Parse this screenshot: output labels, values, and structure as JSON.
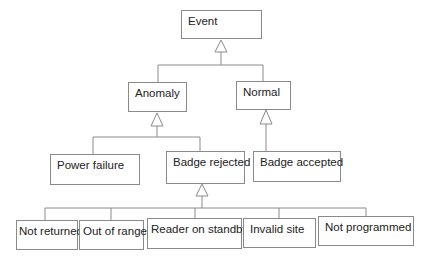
{
  "diagram": {
    "type": "uml-class-hierarchy",
    "nodes": {
      "event": "Event",
      "anomaly": "Anomaly",
      "normal": "Normal",
      "power_failure": "Power failure",
      "badge_rejected": "Badge rejected",
      "badge_accepted": "Badge accepted",
      "not_returned": "Not returned",
      "out_of_range": "Out of range",
      "reader_on_standby": "Reader on standby",
      "invalid_site": "Invalid site",
      "not_programmed": "Not programmed"
    },
    "edges": [
      {
        "from": "anomaly",
        "to": "event",
        "kind": "generalization"
      },
      {
        "from": "normal",
        "to": "event",
        "kind": "generalization"
      },
      {
        "from": "power_failure",
        "to": "anomaly",
        "kind": "generalization"
      },
      {
        "from": "badge_rejected",
        "to": "anomaly",
        "kind": "generalization"
      },
      {
        "from": "badge_accepted",
        "to": "normal",
        "kind": "generalization"
      },
      {
        "from": "not_returned",
        "to": "badge_rejected",
        "kind": "generalization"
      },
      {
        "from": "out_of_range",
        "to": "badge_rejected",
        "kind": "generalization"
      },
      {
        "from": "reader_on_standby",
        "to": "badge_rejected",
        "kind": "generalization"
      },
      {
        "from": "invalid_site",
        "to": "badge_rejected",
        "kind": "generalization"
      },
      {
        "from": "not_programmed",
        "to": "badge_rejected",
        "kind": "generalization"
      }
    ]
  }
}
